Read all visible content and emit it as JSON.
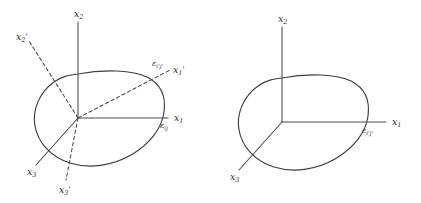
{
  "figure": {
    "type": "technical-diagram",
    "background_color": "#ffffff",
    "line_color": "#4a4a4a",
    "outline_color": "#3d3d3d"
  },
  "panels": [
    {
      "id": "left",
      "name": "original-and-rotated-frame",
      "origin": {
        "x": 78,
        "y": 118
      },
      "axes": [
        {
          "name": "x1-axis",
          "label": "x",
          "subscript": "1",
          "prime": "",
          "style": "solid",
          "label_x": 174,
          "label_y": 113,
          "end_x": 168,
          "end_y": 118
        },
        {
          "name": "x2-axis",
          "label": "x",
          "subscript": "2",
          "prime": "",
          "style": "solid",
          "label_x": 74,
          "label_y": 9,
          "end_x": 78,
          "end_y": 22
        },
        {
          "name": "x3-axis",
          "label": "x",
          "subscript": "3",
          "prime": "",
          "style": "solid",
          "label_x": 27,
          "label_y": 167,
          "end_x": 36,
          "end_y": 165
        },
        {
          "name": "x1-prime-axis",
          "label": "x",
          "subscript": "1",
          "prime": "'",
          "style": "dashed",
          "label_x": 173,
          "label_y": 65,
          "end_x": 170,
          "end_y": 70
        },
        {
          "name": "x2-prime-axis",
          "label": "x",
          "subscript": "2",
          "prime": "'",
          "style": "dashed",
          "label_x": 16,
          "label_y": 32,
          "end_x": 29,
          "end_y": 41
        },
        {
          "name": "x3-prime-axis",
          "label": "x",
          "subscript": "3",
          "prime": "'",
          "style": "dashed",
          "label_x": 59,
          "label_y": 185,
          "end_x": 66,
          "end_y": 180
        }
      ],
      "strain_labels": [
        {
          "name": "strain-eps-ij",
          "symbol": "ε",
          "subscript": "ij",
          "primed": false,
          "label_x": 160,
          "label_y": 122
        },
        {
          "name": "strain-eps-i-prime-j-prime",
          "symbol": "ε",
          "subscript": "i'j'",
          "primed": true,
          "label_x": 152,
          "label_y": 60
        }
      ]
    },
    {
      "id": "right",
      "name": "rotated-frame-only",
      "origin": {
        "x": 282,
        "y": 122
      },
      "axes": [
        {
          "name": "x1-axis",
          "label": "x",
          "subscript": "1",
          "prime": "",
          "style": "solid",
          "label_x": 392,
          "label_y": 117,
          "end_x": 386,
          "end_y": 122
        },
        {
          "name": "x2-axis",
          "label": "x",
          "subscript": "2",
          "prime": "",
          "style": "solid",
          "label_x": 278,
          "label_y": 14,
          "end_x": 282,
          "end_y": 27
        },
        {
          "name": "x3-axis",
          "label": "x",
          "subscript": "3",
          "prime": "",
          "style": "solid",
          "label_x": 230,
          "label_y": 172,
          "end_x": 239,
          "end_y": 170
        }
      ],
      "strain_labels": [
        {
          "name": "strain-eps-i-prime-j-prime",
          "symbol": "ε",
          "subscript": "i'j'",
          "primed": true,
          "label_x": 362,
          "label_y": 127
        }
      ]
    }
  ],
  "geometry": {
    "left_blob_path": "M 78 74 C 104 69 133 70 147 77 C 161 84 166 97 164 112 C 162 128 150 144 131 155 C 112 166 89 169 70 163 C 51 157 38 143 35 126 C 32 109 40 92 54 82 C 62 76 70 75 78 74 Z",
    "right_blob_path": "M 282 78 C 308 73 337 74 351 81 C 365 88 370 101 368 116 C 366 132 354 148 335 159 C 316 170 293 173 274 167 C 255 161 242 147 239 130 C 236 113 244 96 258 86 C 266 80 274 79 282 78 Z",
    "left_axis_segments": {
      "x1": "M 78 118 L 168 118",
      "x2": "M 78 118 L 78 22",
      "x3": "M 78 118 L 36 165",
      "x1p": "M 78 118 L 170 70",
      "x2p": "M 78 118 L 29 41",
      "x3p": "M 78 118 L 66 180"
    },
    "right_axis_segments": {
      "x1": "M 282 122 L 386 122",
      "x2": "M 282 122 L 282 27",
      "x3": "M 282 122 L 239 170"
    }
  }
}
